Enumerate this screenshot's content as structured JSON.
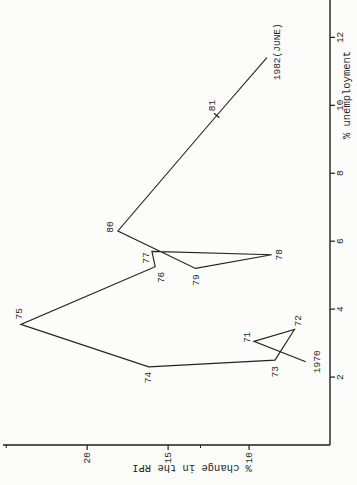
{
  "figure": {
    "background": "#fcfcfb",
    "ink": "#1f1f1f",
    "orientation": "chart rotated 90 degrees counter-clockwise on page"
  },
  "chart_data": {
    "type": "line",
    "title": "",
    "xlabel": "% unemployment",
    "ylabel": "% change in the RPI",
    "xlim": [
      0,
      13.1
    ],
    "ylim": [
      5,
      25.2
    ],
    "x_ticks": [
      2,
      4,
      6,
      8,
      10,
      12
    ],
    "y_ticks": [
      10,
      15,
      20
    ],
    "y_minor_ticks": [
      13,
      25
    ],
    "grid": false,
    "legend": "none",
    "series": [
      {
        "name": "UK % change in RPI vs % unemployment, 1970-1982(June)",
        "points": [
          {
            "label": "1970",
            "x": 2.45,
            "y": 6.5,
            "label_dx": 0,
            "label_dy": 14,
            "label_anchor": "middle"
          },
          {
            "label": "71",
            "x": 3.05,
            "y": 9.7,
            "label_dx": 4,
            "label_dy": -4,
            "label_anchor": "middle"
          },
          {
            "label": "72",
            "x": 3.4,
            "y": 7.2,
            "label_dx": 3,
            "label_dy": 7,
            "label_anchor": "start"
          },
          {
            "label": "73",
            "x": 2.5,
            "y": 8.4,
            "label_dx": -6,
            "label_dy": 3,
            "label_anchor": "end"
          },
          {
            "label": "74",
            "x": 2.3,
            "y": 16.2,
            "label_dx": -5,
            "label_dy": 2,
            "label_anchor": "end"
          },
          {
            "label": "75",
            "x": 3.55,
            "y": 24.1,
            "label_dx": 5,
            "label_dy": 1,
            "label_anchor": "start"
          },
          {
            "label": "76",
            "x": 5.25,
            "y": 15.8,
            "label_dx": -5,
            "label_dy": 9,
            "label_anchor": "end"
          },
          {
            "label": "77",
            "x": 5.7,
            "y": 16.0,
            "label_dx": -1,
            "label_dy": -3,
            "label_anchor": "end"
          },
          {
            "label": "78",
            "x": 5.6,
            "y": 8.6,
            "label_dx": 0,
            "label_dy": 10,
            "label_anchor": "middle"
          },
          {
            "label": "79",
            "x": 5.2,
            "y": 13.3,
            "label_dx": -6,
            "label_dy": 3,
            "label_anchor": "end"
          },
          {
            "label": "80",
            "x": 6.3,
            "y": 18.1,
            "label_dx": 4,
            "label_dy": -5,
            "label_anchor": "middle"
          },
          {
            "label": "81",
            "x": 9.7,
            "y": 12.0,
            "label_dx": 10,
            "label_dy": -2,
            "label_anchor": "middle",
            "marker": "tick"
          },
          {
            "label": "1982(JUNE)",
            "x": 11.4,
            "y": 8.9,
            "label_dx": 6,
            "label_dy": 13,
            "label_anchor": "middle"
          }
        ]
      }
    ]
  }
}
